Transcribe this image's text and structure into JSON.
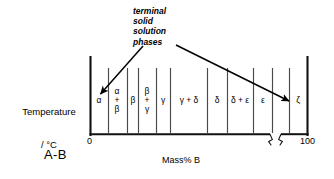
{
  "figure": {
    "name": "binary-phase-diagram-schematic",
    "background": "#ffffff",
    "line_color": "#000000",
    "axis_color": "#1a1a1a",
    "divider_color": "#555555"
  },
  "axes": {
    "y_label_line1": "Temperature",
    "y_label_line2": "/ °C",
    "x_label": "Mass% B",
    "x_ticks": [
      {
        "value": "0",
        "position_pct": 0
      },
      {
        "value": "100",
        "position_pct": 100
      }
    ],
    "x_axis_break": true,
    "plot_left_px": 90,
    "plot_right_px": 308,
    "plot_top_px": 58,
    "plot_bottom_px": 134
  },
  "system": {
    "label": "A-B"
  },
  "annotation": {
    "lines": [
      "terminal",
      "solid",
      "solution",
      "phases"
    ],
    "text": "terminal\nsolid\nsolution\nphases",
    "style": "italic",
    "arrows": [
      {
        "name": "arrow-to-alpha",
        "from_x": 143,
        "from_y": 45,
        "to_x": 99,
        "to_y": 95
      },
      {
        "name": "arrow-to-zeta",
        "from_x": 175,
        "from_y": 45,
        "to_x": 289,
        "to_y": 102
      }
    ]
  },
  "phase_regions": [
    {
      "name": "alpha",
      "label": "α",
      "center_x": 99,
      "center_y": 101,
      "stacked": false
    },
    {
      "name": "alpha-beta",
      "label": "α\n+\nβ",
      "center_x": 117,
      "center_y": 101,
      "stacked": true
    },
    {
      "name": "beta",
      "label": "β",
      "center_x": 133,
      "center_y": 101,
      "stacked": false
    },
    {
      "name": "beta-gamma",
      "label": "β\n+\nγ",
      "center_x": 147,
      "center_y": 101,
      "stacked": true
    },
    {
      "name": "gamma",
      "label": "γ",
      "center_x": 163,
      "center_y": 101,
      "stacked": false
    },
    {
      "name": "gamma-delta",
      "label": "γ + δ",
      "center_x": 189,
      "center_y": 101,
      "stacked": false
    },
    {
      "name": "delta",
      "label": "δ",
      "center_x": 217,
      "center_y": 101,
      "stacked": false
    },
    {
      "name": "delta-epsilon",
      "label": "δ + ε",
      "center_x": 240,
      "center_y": 101,
      "stacked": false
    },
    {
      "name": "epsilon",
      "label": "ε",
      "center_x": 263,
      "center_y": 101,
      "stacked": false
    },
    {
      "name": "zeta",
      "label": "ζ",
      "center_x": 298,
      "center_y": 101,
      "stacked": false
    }
  ],
  "phase_boundaries": [
    {
      "name": "boundary-1",
      "x": 108
    },
    {
      "name": "boundary-2",
      "x": 127
    },
    {
      "name": "boundary-3",
      "x": 138
    },
    {
      "name": "boundary-4",
      "x": 156
    },
    {
      "name": "boundary-5",
      "x": 170
    },
    {
      "name": "boundary-6",
      "x": 207
    },
    {
      "name": "boundary-7",
      "x": 227
    },
    {
      "name": "boundary-8",
      "x": 253
    },
    {
      "name": "boundary-9",
      "x": 272
    },
    {
      "name": "boundary-10",
      "x": 289
    }
  ]
}
